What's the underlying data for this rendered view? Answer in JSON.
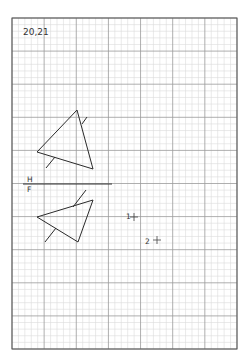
{
  "page": {
    "title_label": "20,21",
    "background_color": "#ffffff"
  },
  "grid": {
    "left": 12,
    "top": 18,
    "width": 225,
    "height": 331,
    "major_spacing_x": 32.14,
    "major_spacing_y": 33.1,
    "minor_per_major": 5,
    "border_color": "#555555",
    "major_color": "#9a9a9a",
    "minor_color": "#dcdcdc"
  },
  "fold_line": {
    "upper_label": "H",
    "lower_label": "F",
    "x1": 23,
    "y1": 184,
    "x2": 112,
    "y2": 184,
    "color": "#333333"
  },
  "views": [
    {
      "name": "horizontal-view",
      "triangle": [
        [
          77,
          110
        ],
        [
          37,
          152
        ],
        [
          93,
          169
        ]
      ],
      "ticks": [
        [
          [
            82,
            124
          ],
          [
            87,
            117
          ]
        ],
        [
          [
            55,
            157
          ],
          [
            46,
            168
          ]
        ]
      ]
    },
    {
      "name": "frontal-view",
      "triangle": [
        [
          93,
          200
        ],
        [
          37,
          217
        ],
        [
          78,
          242
        ]
      ],
      "ticks": [
        [
          [
            73,
            207
          ],
          [
            86,
            190
          ]
        ],
        [
          [
            56,
            228
          ],
          [
            45,
            242
          ]
        ]
      ]
    }
  ],
  "points": [
    {
      "label": "1",
      "label_x": 126,
      "label_y": 219,
      "cross_x": 134,
      "cross_y": 217
    },
    {
      "label": "2",
      "label_x": 145,
      "label_y": 244,
      "cross_x": 157,
      "cross_y": 240
    }
  ],
  "stroke_color": "#2a2a2a"
}
